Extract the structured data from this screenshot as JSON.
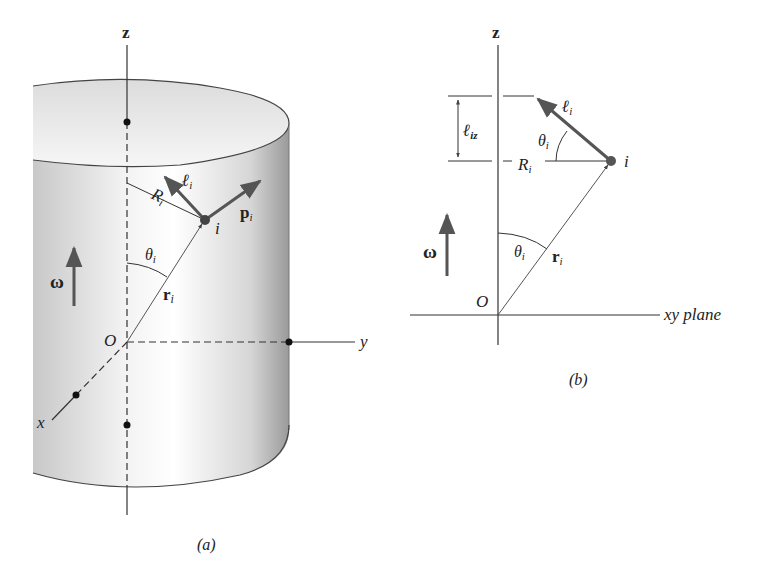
{
  "figure_a": {
    "caption": "(a)",
    "labels": {
      "z_axis": "z",
      "y_axis": "y",
      "x_axis": "x",
      "origin": "O",
      "omega": "ω",
      "angle": "θ",
      "angle_sub": "i",
      "position_vector": "r",
      "position_sub": "i",
      "radius": "R",
      "radius_sub": "i",
      "particle": "i",
      "angular_momentum": "ℓ",
      "angular_momentum_sub": "i",
      "momentum": "p",
      "momentum_sub": "i"
    }
  },
  "figure_b": {
    "caption": "(b)",
    "labels": {
      "z_axis": "z",
      "plane": "xy plane",
      "origin": "O",
      "omega": "ω",
      "angle_lower": "θ",
      "angle_lower_sub": "i",
      "angle_upper": "θ",
      "angle_upper_sub": "i",
      "position_vector": "r",
      "position_sub": "i",
      "radius": "R",
      "radius_sub": "i",
      "particle": "i",
      "angular_momentum": "ℓ",
      "angular_momentum_sub": "i",
      "z_component": "ℓ",
      "z_component_sub": "iz"
    }
  },
  "colors": {
    "line": "#333333",
    "vector": "#555555",
    "cylinder_light": "#f4f4f4",
    "cylinder_dark": "#9a9a9a"
  }
}
